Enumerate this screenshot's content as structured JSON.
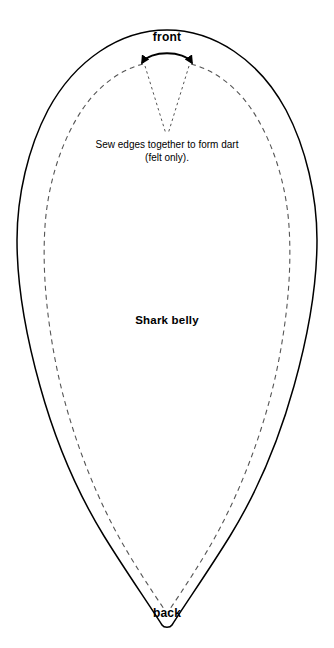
{
  "document": {
    "type": "sewing-pattern-template",
    "piece_name": "Shark belly",
    "background_color": "#ffffff",
    "line_color": "#000000",
    "seam_line_color": "#555555"
  },
  "labels": {
    "front": "front",
    "back": "back",
    "piece": "Shark belly"
  },
  "note": {
    "line1": "Sew edges together to form dart",
    "line2": "(felt only)."
  },
  "markings": {
    "cut_line_style": "solid",
    "seam_line_style": "dashed",
    "dart_line_style": "dotted",
    "dart_arrow": "double-headed-curved-arrow"
  }
}
